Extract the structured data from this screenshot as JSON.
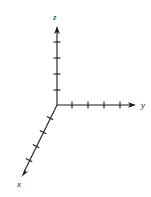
{
  "figure": {
    "type": "3d-coordinate-axes",
    "width": 151,
    "height": 197,
    "background_color": "#ffffff",
    "stroke_color": "#1a1a1a",
    "stroke_width": 1,
    "origin": {
      "x": 57,
      "y": 105
    }
  },
  "axes": [
    {
      "name": "z",
      "label": "z",
      "label_position": {
        "x": 53,
        "y": 13
      },
      "direction": "up",
      "start": {
        "x": 57,
        "y": 105
      },
      "end": {
        "x": 57,
        "y": 27
      },
      "arrowhead": true,
      "tick_count": 4,
      "ticks": [
        {
          "index": 1,
          "x": 57,
          "y": 90
        },
        {
          "index": 2,
          "x": 57,
          "y": 74
        },
        {
          "index": 3,
          "x": 57,
          "y": 58
        },
        {
          "index": 4,
          "x": 57,
          "y": 42
        }
      ],
      "tick_length": 7,
      "tick_orientation": "horizontal"
    },
    {
      "name": "y",
      "label": "y",
      "label_position": {
        "x": 141,
        "y": 101
      },
      "direction": "right",
      "start": {
        "x": 57,
        "y": 105
      },
      "end": {
        "x": 135,
        "y": 105
      },
      "arrowhead": true,
      "tick_count": 4,
      "ticks": [
        {
          "index": 1,
          "x": 72,
          "y": 105
        },
        {
          "index": 2,
          "x": 88,
          "y": 105
        },
        {
          "index": 3,
          "x": 104,
          "y": 105
        },
        {
          "index": 4,
          "x": 120,
          "y": 105
        }
      ],
      "tick_length": 7,
      "tick_orientation": "vertical"
    },
    {
      "name": "x",
      "label": "x",
      "label_position": {
        "x": 17,
        "y": 180
      },
      "direction": "down-left-diagonal",
      "start": {
        "x": 57,
        "y": 105
      },
      "end": {
        "x": 22,
        "y": 176
      },
      "arrowhead": true,
      "tick_count": 4,
      "ticks": [
        {
          "index": 1,
          "x": 50,
          "y": 119
        },
        {
          "index": 2,
          "x": 43,
          "y": 133
        },
        {
          "index": 3,
          "x": 36,
          "y": 147
        },
        {
          "index": 4,
          "x": 29,
          "y": 161
        }
      ],
      "tick_length": 7,
      "tick_orientation": "perpendicular"
    }
  ]
}
